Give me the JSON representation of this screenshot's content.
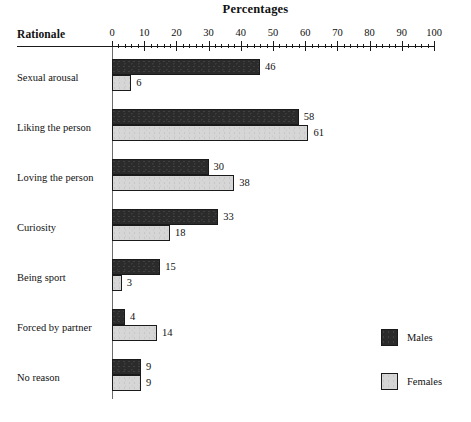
{
  "chart_data": {
    "type": "bar",
    "orientation": "horizontal",
    "title": "Percentages",
    "xlabel": "Percentages",
    "ylabel": "Rationale",
    "xlim": [
      0,
      100
    ],
    "xticks": [
      0,
      10,
      20,
      30,
      40,
      50,
      60,
      70,
      80,
      90,
      100
    ],
    "xtick_labels": [
      "0",
      "10",
      "20",
      "30",
      "40",
      "50",
      "60",
      "70",
      "80",
      "90",
      "100"
    ],
    "minor_tick_step": 2,
    "grid": false,
    "legend_position": "lower-right",
    "categories": [
      "Sexual arousal",
      "Liking the person",
      "Loving the person",
      "Curiosity",
      "Being sport",
      "Forced by partner",
      "No reason"
    ],
    "series": [
      {
        "name": "Males",
        "color": "#2b2b2b",
        "values": [
          46,
          58,
          30,
          33,
          15,
          4,
          9
        ],
        "labels": [
          "46",
          "58",
          "30",
          "33",
          "15",
          "4",
          "9"
        ]
      },
      {
        "name": "Females",
        "color": "#d6d6d6",
        "values": [
          6,
          61,
          38,
          18,
          3,
          14,
          9
        ],
        "labels": [
          "6",
          "61",
          "38",
          "18",
          "3",
          "14",
          "9"
        ]
      }
    ]
  },
  "axis": {
    "row_header": "Rationale",
    "title": "Percentages"
  },
  "legend": {
    "items": [
      {
        "label": "Males",
        "swatch": "males"
      },
      {
        "label": "Females",
        "swatch": "females"
      }
    ]
  }
}
